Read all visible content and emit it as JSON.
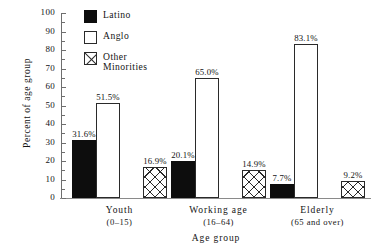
{
  "chart_data": {
    "type": "bar",
    "title": "",
    "xlabel": "Age group",
    "ylabel": "Percent of age group",
    "ylim": [
      0,
      100
    ],
    "ytick_step": 10,
    "yticks": [
      "100",
      "90",
      "80",
      "70",
      "60",
      "50",
      "40",
      "30",
      "20",
      "10",
      "0"
    ],
    "grid": false,
    "legend_position": "upper-left-inside",
    "categories": [
      "Youth",
      "Working age",
      "Elderly"
    ],
    "category_sublabels": [
      "(0–15)",
      "(16–64)",
      "(65 and over)"
    ],
    "series": [
      {
        "name": "Latino",
        "fill": "solid-black",
        "values": [
          31.6,
          20.1,
          7.7
        ],
        "labels": [
          "31.6%",
          "20.1%",
          "7.7%"
        ]
      },
      {
        "name": "Anglo",
        "fill": "white-outline",
        "values": [
          51.5,
          65.0,
          83.1
        ],
        "labels": [
          "51.5%",
          "65.0%",
          "83.1%"
        ]
      },
      {
        "name": "Other\nMinorities",
        "fill": "cross-hatch",
        "values": [
          16.9,
          14.9,
          9.2
        ],
        "labels": [
          "16.9%",
          "14.9%",
          "9.2%"
        ]
      }
    ],
    "colors": {
      "latino": "#0d0d0d",
      "anglo": "#ffffff",
      "other_minorities_outline": "#2a2a2a",
      "axis": "#6e6e6e",
      "background": "#ffffff",
      "text": "#141414"
    }
  }
}
